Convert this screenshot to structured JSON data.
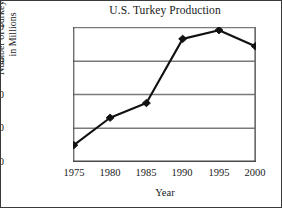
{
  "chart_data": {
    "type": "line",
    "title": "U.S. Turkey Production",
    "xlabel": "Year",
    "ylabel": "Number of Turkeys,\nin Millions",
    "ylabel_line1": "Number of Turkeys,",
    "ylabel_line2": "in Millions",
    "x": [
      1975,
      1980,
      1985,
      1990,
      1995,
      2000
    ],
    "categories": [
      "1975",
      "1980",
      "1985",
      "1990",
      "1995",
      "2000"
    ],
    "values": [
      124,
      165,
      187,
      283,
      296,
      272
    ],
    "series": [
      {
        "name": "Number of Turkeys, in Millions",
        "values": [
          124,
          165,
          187,
          283,
          296,
          272
        ]
      }
    ],
    "xlim": [
      1975,
      2000
    ],
    "ylim": [
      100,
      300
    ],
    "yticks": [
      100,
      150,
      200,
      250,
      300
    ],
    "ytick_labels": [
      "100",
      "150",
      "200",
      "250",
      "300"
    ],
    "xticks": [
      1975,
      1980,
      1985,
      1990,
      1995,
      2000
    ],
    "xtick_labels": [
      "1975",
      "1980",
      "1985",
      "1990",
      "1995",
      "2000"
    ],
    "grid": "horizontal",
    "legend": "none",
    "marker": "diamond",
    "line_color": "#111111",
    "marker_color": "#111111",
    "grid_color": "#7a7a7a",
    "axis_color": "#6e6e6e",
    "background_color": "#ffffff",
    "border_color": "#3a3a3a"
  }
}
